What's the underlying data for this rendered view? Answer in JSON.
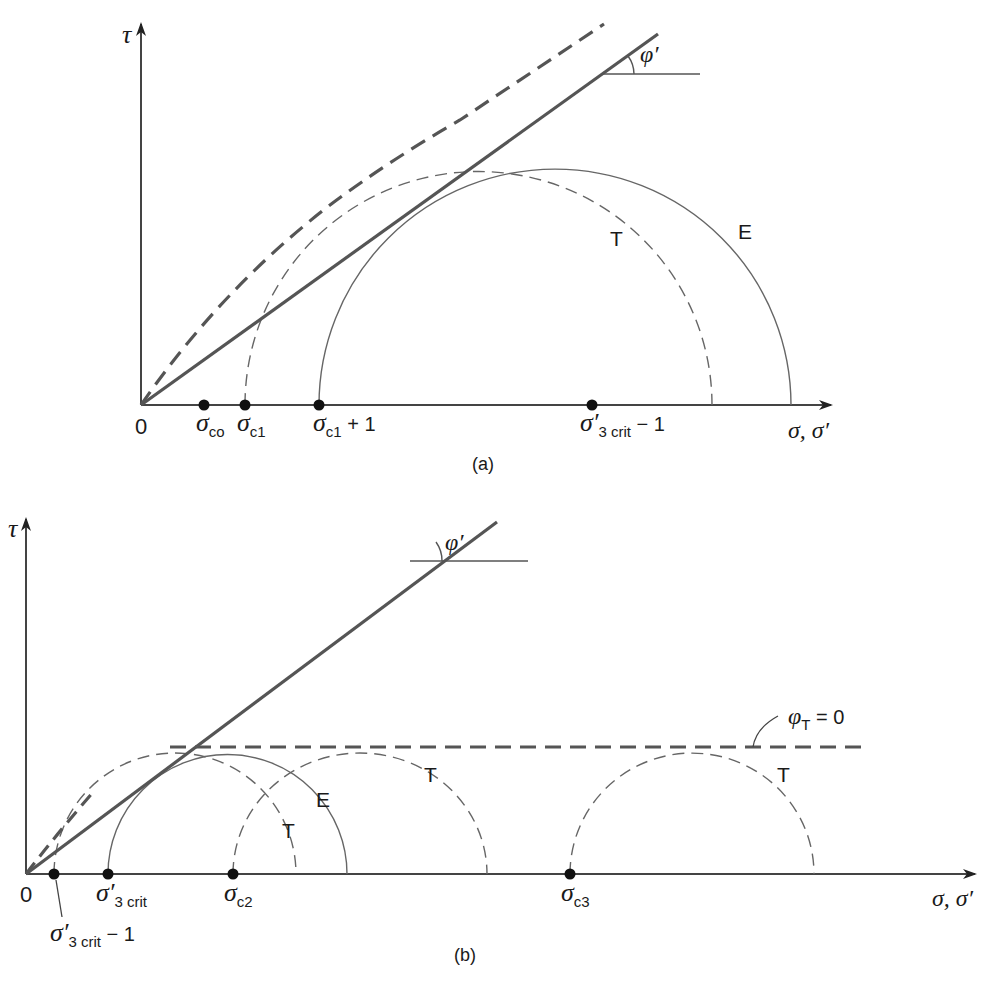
{
  "figure_a": {
    "caption": "(a)",
    "y_axis_label": "τ",
    "x_axis_label": "σ, σ′",
    "origin_label": "0",
    "angle_label": "φ′",
    "circle_labels": {
      "total": "T",
      "effective": "E"
    },
    "points": [
      {
        "sym": "σ",
        "sub": "co",
        "suffix": ""
      },
      {
        "sym": "σ",
        "sub": "c1",
        "suffix": ""
      },
      {
        "sym": "σ",
        "sub": "c1",
        "suffix": " + 1"
      },
      {
        "sym": "σ′",
        "sub": "3 crit",
        "suffix": " − 1"
      }
    ]
  },
  "figure_b": {
    "caption": "(b)",
    "y_axis_label": "τ",
    "x_axis_label": "σ, σ′",
    "origin_label": "0",
    "angle_label": "φ′",
    "phi_t_label": {
      "sym": "φ",
      "sub": "T",
      "suffix": " = 0"
    },
    "circle_labels": {
      "total": "T",
      "effective": "E"
    },
    "points": [
      {
        "sym": "σ′",
        "sub": "3 crit",
        "suffix": " − 1"
      },
      {
        "sym": "σ′",
        "sub": "3 crit",
        "suffix": ""
      },
      {
        "sym": "σ",
        "sub": "c2",
        "suffix": ""
      },
      {
        "sym": "σ",
        "sub": "c3",
        "suffix": ""
      }
    ]
  },
  "colors": {
    "line": "#555555",
    "axis": "#333333",
    "dot": "#111111"
  }
}
